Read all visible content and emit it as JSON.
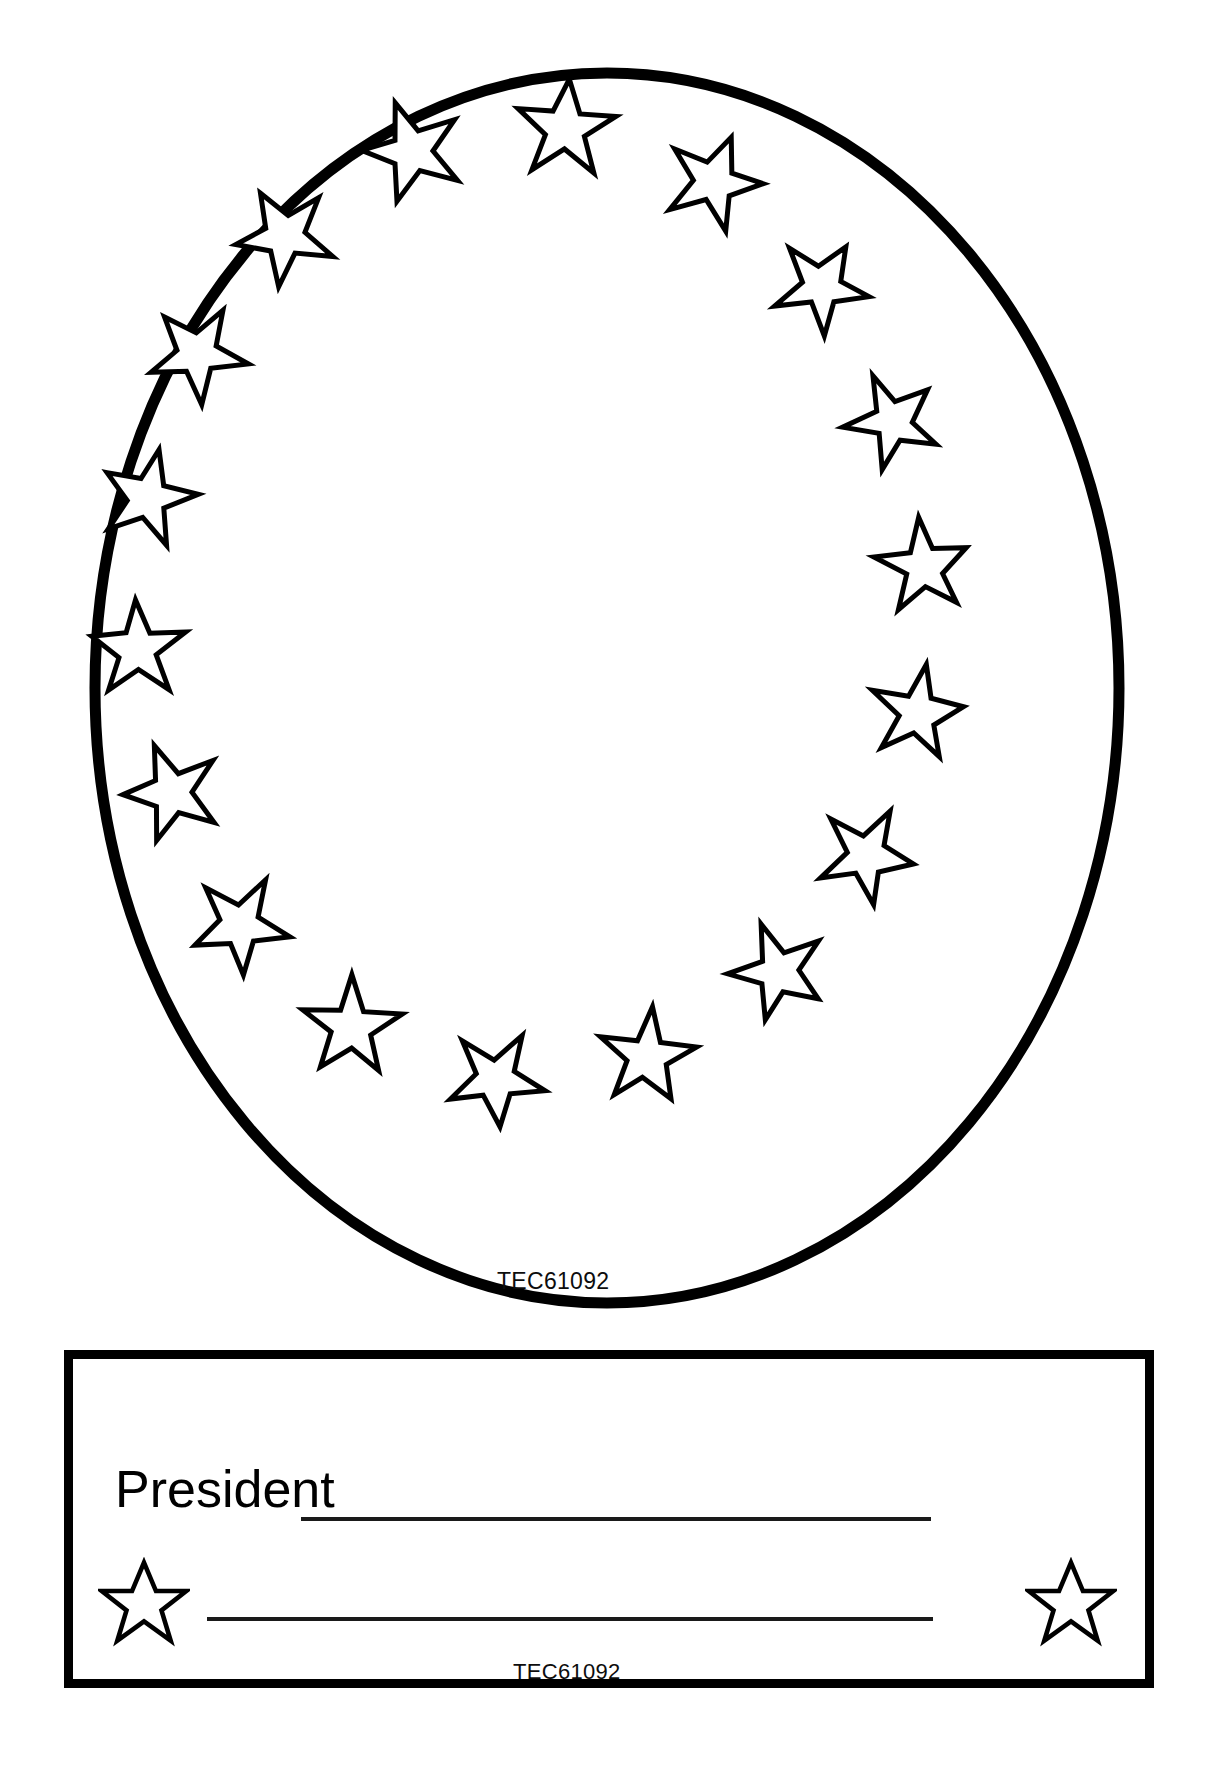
{
  "page": {
    "background_color": "#ffffff",
    "ink_color": "#000000",
    "width": 1215,
    "height": 1788
  },
  "oval_frame": {
    "name": "oval-star-frame",
    "shape": "ellipse",
    "stroke_color": "#000000",
    "stroke_width": 11,
    "center": {
      "cx": 607,
      "cy": 688
    },
    "radius": {
      "rx": 512,
      "ry": 615
    },
    "star_count": 20,
    "star_outline_color": "#000000",
    "star_fill_color": "#ffffff",
    "code_label": "TEC61092",
    "stars": [
      {
        "cx": 566,
        "cy": 127,
        "r": 47,
        "rot": 4
      },
      {
        "cx": 712,
        "cy": 180,
        "r": 45,
        "rot": 20
      },
      {
        "cx": 414,
        "cy": 149,
        "r": 48,
        "rot": -18
      },
      {
        "cx": 822,
        "cy": 285,
        "r": 44,
        "rot": 30
      },
      {
        "cx": 284,
        "cy": 234,
        "r": 47,
        "rot": -28
      },
      {
        "cx": 893,
        "cy": 420,
        "r": 44,
        "rot": 44
      },
      {
        "cx": 195,
        "cy": 352,
        "r": 47,
        "rot": -40
      },
      {
        "cx": 925,
        "cy": 565,
        "r": 44,
        "rot": 62
      },
      {
        "cx": 146,
        "cy": 497,
        "r": 46,
        "rot": -55
      },
      {
        "cx": 919,
        "cy": 712,
        "r": 44,
        "rot": 78
      },
      {
        "cx": 136,
        "cy": 648,
        "r": 46,
        "rot": -70
      },
      {
        "cx": 868,
        "cy": 855,
        "r": 45,
        "rot": 96
      },
      {
        "cx": 170,
        "cy": 793,
        "r": 46,
        "rot": -88
      },
      {
        "cx": 779,
        "cy": 972,
        "r": 45,
        "rot": 118
      },
      {
        "cx": 238,
        "cy": 925,
        "r": 46,
        "rot": -108
      },
      {
        "cx": 648,
        "cy": 1058,
        "r": 45,
        "rot": 140
      },
      {
        "cx": 350,
        "cy": 1028,
        "r": 47,
        "rot": -132
      },
      {
        "cx": 496,
        "cy": 1080,
        "r": 45,
        "rot": 166
      }
    ]
  },
  "nameplate": {
    "name": "president-nameplate",
    "border_color": "#000000",
    "border_width": 9,
    "label": "President",
    "rules": [
      {
        "name": "president-name-line"
      },
      {
        "name": "signature-line"
      }
    ],
    "stars": [
      {
        "name": "plate-star-left"
      },
      {
        "name": "plate-star-right"
      }
    ],
    "code_label": "TEC61092"
  }
}
